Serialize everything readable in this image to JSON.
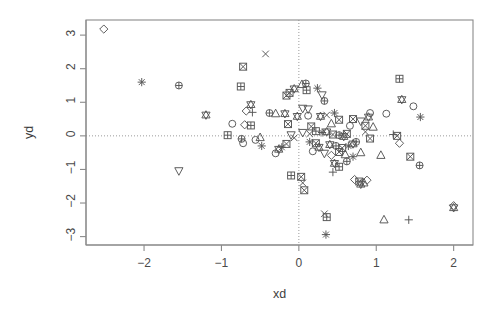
{
  "chart_data": {
    "type": "scatter",
    "title": "",
    "xlabel": "xd",
    "ylabel": "yd",
    "xlim": [
      -2.75,
      2.25
    ],
    "ylim": [
      -3.25,
      3.45
    ],
    "xticks": [
      -2,
      -1,
      0,
      1,
      2
    ],
    "xticklabels": [
      "−2",
      "−1",
      "0",
      "1",
      "2"
    ],
    "yticks": [
      3,
      2,
      1,
      0,
      -1,
      -2,
      -3
    ],
    "yticklabels": [
      "3",
      "2",
      "1",
      "0",
      "−1",
      "−2",
      "−3"
    ],
    "grid": false,
    "reference_lines": [
      {
        "axis": "x",
        "value": 0,
        "style": "dotted"
      },
      {
        "axis": "y",
        "value": 0,
        "style": "dotted"
      }
    ],
    "legend": "none",
    "point_color": "#555555",
    "frame_color": "#8a8a8a",
    "points": [
      {
        "x": -2.52,
        "y": 3.18,
        "sym": "diamond"
      },
      {
        "x": -2.03,
        "y": 1.6,
        "sym": "asterisk"
      },
      {
        "x": -1.55,
        "y": 1.5,
        "sym": "circle-plus"
      },
      {
        "x": -1.2,
        "y": 0.62,
        "sym": "star"
      },
      {
        "x": -0.86,
        "y": 0.36,
        "sym": "circle"
      },
      {
        "x": -0.92,
        "y": 0.02,
        "sym": "square-plus"
      },
      {
        "x": -1.55,
        "y": -1.04,
        "sym": "triangle-down"
      },
      {
        "x": -0.72,
        "y": 2.06,
        "sym": "square-box"
      },
      {
        "x": -0.75,
        "y": 1.47,
        "sym": "square-plus"
      },
      {
        "x": -0.43,
        "y": 2.44,
        "sym": "cross"
      },
      {
        "x": -0.62,
        "y": 0.93,
        "sym": "star"
      },
      {
        "x": -0.68,
        "y": 0.74,
        "sym": "diamond"
      },
      {
        "x": -0.6,
        "y": 0.7,
        "sym": "plus"
      },
      {
        "x": -0.38,
        "y": 0.68,
        "sym": "circle-plus"
      },
      {
        "x": -0.3,
        "y": 0.66,
        "sym": "triangle-up"
      },
      {
        "x": -0.7,
        "y": 0.33,
        "sym": "diamond"
      },
      {
        "x": -0.62,
        "y": 0.31,
        "sym": "square-plus"
      },
      {
        "x": -0.74,
        "y": -0.09,
        "sym": "circle-plus"
      },
      {
        "x": -0.72,
        "y": -0.22,
        "sym": "circle"
      },
      {
        "x": -0.56,
        "y": -0.12,
        "sym": "circle"
      },
      {
        "x": -0.5,
        "y": -0.05,
        "sym": "triangle-up"
      },
      {
        "x": -0.48,
        "y": -0.3,
        "sym": "asterisk"
      },
      {
        "x": -0.18,
        "y": 0.66,
        "sym": "star"
      },
      {
        "x": -0.14,
        "y": 0.35,
        "sym": "square-box"
      },
      {
        "x": -0.1,
        "y": 0.03,
        "sym": "triangle-down"
      },
      {
        "x": -0.06,
        "y": -0.06,
        "sym": "cross"
      },
      {
        "x": -0.16,
        "y": -0.24,
        "sym": "square-box"
      },
      {
        "x": -0.22,
        "y": -0.34,
        "sym": "asterisk"
      },
      {
        "x": -0.26,
        "y": -0.4,
        "sym": "star"
      },
      {
        "x": -0.3,
        "y": -0.52,
        "sym": "circle"
      },
      {
        "x": -0.1,
        "y": -1.18,
        "sym": "square-plus"
      },
      {
        "x": 0.03,
        "y": -1.22,
        "sym": "square-box"
      },
      {
        "x": 0.05,
        "y": -1.4,
        "sym": "cross"
      },
      {
        "x": 0.07,
        "y": -1.62,
        "sym": "square-box"
      },
      {
        "x": 0.04,
        "y": 1.53,
        "sym": "triangle-up"
      },
      {
        "x": 0.09,
        "y": 1.56,
        "sym": "circle-plus"
      },
      {
        "x": -0.06,
        "y": 1.4,
        "sym": "star"
      },
      {
        "x": -0.12,
        "y": 1.28,
        "sym": "square-box"
      },
      {
        "x": -0.16,
        "y": 1.2,
        "sym": "square-box"
      },
      {
        "x": 0.1,
        "y": 1.36,
        "sym": "square-plus"
      },
      {
        "x": 0.24,
        "y": 1.42,
        "sym": "asterisk"
      },
      {
        "x": 0.3,
        "y": 1.22,
        "sym": "triangle-down"
      },
      {
        "x": 0.33,
        "y": 1.04,
        "sym": "circle-plus"
      },
      {
        "x": 0.05,
        "y": 0.82,
        "sym": "triangle-down"
      },
      {
        "x": 0.12,
        "y": 0.8,
        "sym": "triangle-down"
      },
      {
        "x": -0.02,
        "y": 0.58,
        "sym": "star"
      },
      {
        "x": 0.12,
        "y": 0.6,
        "sym": "circle"
      },
      {
        "x": 0.28,
        "y": 0.58,
        "sym": "star"
      },
      {
        "x": 0.36,
        "y": 0.62,
        "sym": "cross"
      },
      {
        "x": 0.46,
        "y": 0.68,
        "sym": "asterisk"
      },
      {
        "x": 0.52,
        "y": 0.48,
        "sym": "square-box"
      },
      {
        "x": 0.16,
        "y": 0.28,
        "sym": "square-box"
      },
      {
        "x": 0.42,
        "y": 0.36,
        "sym": "triangle-up"
      },
      {
        "x": 0.05,
        "y": 0.1,
        "sym": "triangle-down"
      },
      {
        "x": 0.14,
        "y": 0.06,
        "sym": "cross"
      },
      {
        "x": 0.22,
        "y": 0.14,
        "sym": "square-plus"
      },
      {
        "x": 0.3,
        "y": 0.1,
        "sym": "asterisk"
      },
      {
        "x": 0.36,
        "y": 0.12,
        "sym": "star"
      },
      {
        "x": 0.44,
        "y": 0.04,
        "sym": "square-box"
      },
      {
        "x": 0.52,
        "y": 0.02,
        "sym": "circle-plus"
      },
      {
        "x": 0.58,
        "y": -0.02,
        "sym": "star"
      },
      {
        "x": 0.62,
        "y": 0.06,
        "sym": "square-box"
      },
      {
        "x": 0.14,
        "y": -0.18,
        "sym": "asterisk"
      },
      {
        "x": 0.22,
        "y": -0.22,
        "sym": "square-box"
      },
      {
        "x": 0.26,
        "y": -0.34,
        "sym": "star"
      },
      {
        "x": 0.18,
        "y": -0.46,
        "sym": "circle"
      },
      {
        "x": 0.4,
        "y": -0.26,
        "sym": "star"
      },
      {
        "x": 0.48,
        "y": -0.3,
        "sym": "circle-plus"
      },
      {
        "x": 0.56,
        "y": -0.36,
        "sym": "square-box"
      },
      {
        "x": 0.64,
        "y": -0.3,
        "sym": "asterisk"
      },
      {
        "x": 0.7,
        "y": -0.24,
        "sym": "star"
      },
      {
        "x": 0.74,
        "y": -0.18,
        "sym": "circle-plus"
      },
      {
        "x": 0.33,
        "y": -0.52,
        "sym": "triangle-down"
      },
      {
        "x": 0.42,
        "y": -0.58,
        "sym": "diamond"
      },
      {
        "x": 0.52,
        "y": -0.48,
        "sym": "square-box"
      },
      {
        "x": 0.6,
        "y": -0.56,
        "sym": "triangle-up"
      },
      {
        "x": 0.7,
        "y": -0.62,
        "sym": "asterisk"
      },
      {
        "x": 0.8,
        "y": -0.5,
        "sym": "triangle-up"
      },
      {
        "x": 0.46,
        "y": -0.82,
        "sym": "star"
      },
      {
        "x": 0.52,
        "y": -0.92,
        "sym": "square-plus"
      },
      {
        "x": 0.62,
        "y": -0.76,
        "sym": "circle-plus"
      },
      {
        "x": 0.44,
        "y": -1.08,
        "sym": "plus"
      },
      {
        "x": 0.72,
        "y": -1.3,
        "sym": "diamond"
      },
      {
        "x": 0.78,
        "y": -1.36,
        "sym": "square-box"
      },
      {
        "x": 0.84,
        "y": -1.4,
        "sym": "triangle-up"
      },
      {
        "x": 0.88,
        "y": -1.32,
        "sym": "diamond"
      },
      {
        "x": 0.8,
        "y": -1.44,
        "sym": "star"
      },
      {
        "x": 0.33,
        "y": -2.32,
        "sym": "cross"
      },
      {
        "x": 0.36,
        "y": -2.42,
        "sym": "square-plus"
      },
      {
        "x": 0.35,
        "y": -2.94,
        "sym": "asterisk"
      },
      {
        "x": 1.1,
        "y": -2.5,
        "sym": "triangle-up"
      },
      {
        "x": 1.42,
        "y": -2.5,
        "sym": "plus"
      },
      {
        "x": 1.3,
        "y": 1.7,
        "sym": "square-plus"
      },
      {
        "x": 1.33,
        "y": 1.08,
        "sym": "star"
      },
      {
        "x": 1.48,
        "y": 0.88,
        "sym": "circle"
      },
      {
        "x": 1.13,
        "y": 0.66,
        "sym": "circle"
      },
      {
        "x": 1.57,
        "y": 0.56,
        "sym": "asterisk"
      },
      {
        "x": 1.22,
        "y": 0.04,
        "sym": "plus"
      },
      {
        "x": 1.27,
        "y": 0.0,
        "sym": "square-box"
      },
      {
        "x": 1.3,
        "y": -0.22,
        "sym": "diamond"
      },
      {
        "x": 1.44,
        "y": -0.62,
        "sym": "square-box"
      },
      {
        "x": 1.56,
        "y": -0.88,
        "sym": "circle-plus"
      },
      {
        "x": 1.06,
        "y": -0.58,
        "sym": "triangle-up"
      },
      {
        "x": 2.0,
        "y": -2.08,
        "sym": "diamond"
      },
      {
        "x": 2.0,
        "y": -2.14,
        "sym": "star"
      },
      {
        "x": 0.92,
        "y": 0.68,
        "sym": "circle"
      },
      {
        "x": 0.9,
        "y": 0.56,
        "sym": "star"
      },
      {
        "x": 0.86,
        "y": 0.3,
        "sym": "square-box"
      },
      {
        "x": 0.96,
        "y": 0.26,
        "sym": "triangle-up"
      },
      {
        "x": 0.8,
        "y": 0.44,
        "sym": "triangle-down"
      },
      {
        "x": 0.86,
        "y": 0.12,
        "sym": "cross"
      },
      {
        "x": 0.92,
        "y": -0.08,
        "sym": "square-box"
      },
      {
        "x": 0.7,
        "y": 0.5,
        "sym": "square-box"
      },
      {
        "x": 0.66,
        "y": 0.3,
        "sym": "circle"
      }
    ]
  }
}
